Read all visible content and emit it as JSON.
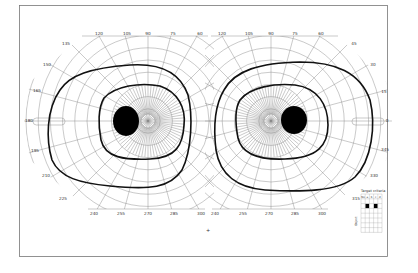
{
  "chart_data": {
    "type": "diagram",
    "title": "",
    "eyes": [
      {
        "name": "left",
        "center": [
          148,
          121
        ],
        "meridian_labels": [
          "120",
          "105",
          "90",
          "75",
          "60",
          "135",
          "150",
          "165",
          "180",
          "195",
          "210",
          "225",
          "240",
          "255",
          "270",
          "285",
          "300"
        ],
        "isopters": [
          {
            "name": "outer",
            "extent_deg": {
              "temporal": 90,
              "nasal": 55,
              "superior": 55,
              "inferior": 67
            }
          },
          {
            "name": "inner",
            "extent_deg": {
              "temporal": 45,
              "nasal": 35,
              "superior": 36,
              "inferior": 38
            }
          }
        ],
        "blind_spot": {
          "center_deg": [
            -15,
            0
          ],
          "size": "filled"
        }
      },
      {
        "name": "right",
        "center": [
          271,
          121
        ],
        "meridian_labels": [
          "120",
          "105",
          "90",
          "75",
          "60",
          "45",
          "30",
          "15",
          "0",
          "345",
          "330",
          "315",
          "240",
          "255",
          "270",
          "285",
          "300"
        ],
        "isopters": [
          {
            "name": "outer",
            "extent_deg": {
              "temporal": 90,
              "nasal": 55,
              "superior": 58,
              "inferior": 68
            }
          },
          {
            "name": "inner",
            "extent_deg": {
              "temporal": 55,
              "nasal": 35,
              "superior": 36,
              "inferior": 38
            }
          }
        ],
        "blind_spot": {
          "center_deg": [
            15,
            0
          ],
          "size": "filled"
        }
      }
    ],
    "radial_ticks": [
      "10",
      "20",
      "30",
      "40",
      "50",
      "60",
      "70",
      "80",
      "90"
    ]
  },
  "labels": {
    "left_top": [
      "120",
      "105",
      "90",
      "75",
      "60"
    ],
    "left_side": [
      "135",
      "150",
      "165",
      "180",
      "195",
      "210",
      "225"
    ],
    "left_bottom": [
      "240",
      "255",
      "270",
      "285",
      "300"
    ],
    "right_top": [
      "120",
      "105",
      "90",
      "75",
      "60"
    ],
    "right_side": [
      "45",
      "30",
      "15",
      "0",
      "345",
      "330",
      "315"
    ],
    "right_bottom": [
      "240",
      "255",
      "270",
      "285",
      "300"
    ],
    "center_mark": "+"
  },
  "legend": {
    "title": "Target criteria",
    "headers": [
      "No",
      "a",
      "b",
      "c",
      "d"
    ],
    "side_label": "Object",
    "filled_cells": [
      [
        2,
        1
      ],
      [
        2,
        3
      ]
    ]
  },
  "colors": {
    "grid": "#888888",
    "isopter": "#111111",
    "blind_spot": "#000000",
    "frame": "#777777"
  }
}
